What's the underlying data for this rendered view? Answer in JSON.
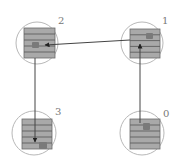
{
  "diagram": {
    "type": "directed-graph",
    "colors": {
      "background": "#ffffff",
      "circle_stroke": "#b8b8b8",
      "square_fill": "#a9a9a9",
      "square_stripe": "#5e5e5e",
      "square_border": "#6a6a6a",
      "token_fill": "#7a7a7a",
      "edge": "#444444",
      "label": "#777777"
    },
    "nodes": [
      {
        "id": "0",
        "label": "0",
        "cx": 142,
        "cy": 133,
        "r": 22,
        "sq": [
          130,
          119,
          30,
          30
        ],
        "label_xy": [
          163,
          117
        ],
        "token": [
          143,
          123,
          7,
          7
        ]
      },
      {
        "id": "1",
        "label": "1",
        "cx": 142,
        "cy": 43,
        "r": 21,
        "sq": [
          130,
          29,
          30,
          29
        ],
        "label_xy": [
          162,
          24
        ],
        "token": [
          146,
          33,
          7,
          6
        ]
      },
      {
        "id": "2",
        "label": "2",
        "cx": 37,
        "cy": 43,
        "r": 21,
        "sq": [
          24,
          28,
          31,
          30
        ],
        "label_xy": [
          58,
          24
        ],
        "token": [
          32,
          42,
          7,
          6
        ]
      },
      {
        "id": "3",
        "label": "3",
        "cx": 34,
        "cy": 133,
        "r": 22,
        "sq": [
          22,
          119,
          30,
          30
        ],
        "label_xy": [
          55,
          115
        ],
        "token": [
          39,
          142,
          8,
          7
        ]
      }
    ],
    "edges": [
      {
        "from": "0",
        "to": "1",
        "x1": 140,
        "y1": 123,
        "x2": 140,
        "y2": 44
      },
      {
        "from": "1",
        "to": "2",
        "x1": 130,
        "y1": 40,
        "x2": 45,
        "y2": 45
      },
      {
        "from": "2",
        "to": "3",
        "x1": 35,
        "y1": 58,
        "x2": 35,
        "y2": 142
      }
    ]
  }
}
